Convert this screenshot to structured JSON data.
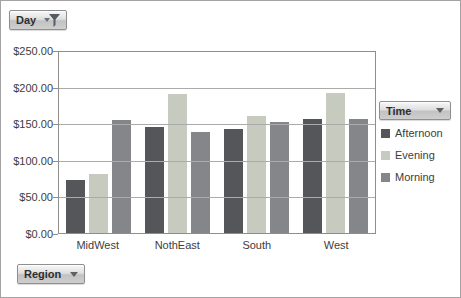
{
  "field_buttons": {
    "day": "Day",
    "time": "Time",
    "region": "Region"
  },
  "colors": {
    "gridline": "#ababab",
    "plot_border": "#8e8e8e",
    "axis_text": "#3d3d3d",
    "button_border": "#8f8f8f",
    "funnel_icon": "#5a6068"
  },
  "chart_data": {
    "type": "bar",
    "title": "",
    "categories": [
      "MidWest",
      "NothEast",
      "South",
      "West"
    ],
    "series": [
      {
        "name": "Afternoon",
        "color": "#55565a",
        "values": [
          73,
          146,
          143,
          158
        ]
      },
      {
        "name": "Evening",
        "color": "#c6cabf",
        "values": [
          81,
          192,
          162,
          193
        ]
      },
      {
        "name": "Morning",
        "color": "#84868a",
        "values": [
          156,
          140,
          153,
          157
        ]
      }
    ],
    "ylim": [
      0,
      250
    ],
    "ytick_labels": [
      "$250.00",
      "$200.00",
      "$150.00",
      "$100.00",
      "$50.00",
      "$0.00"
    ],
    "grid": true,
    "legend_title": "Time",
    "legend_position": "right",
    "xlabel": "",
    "ylabel": ""
  }
}
